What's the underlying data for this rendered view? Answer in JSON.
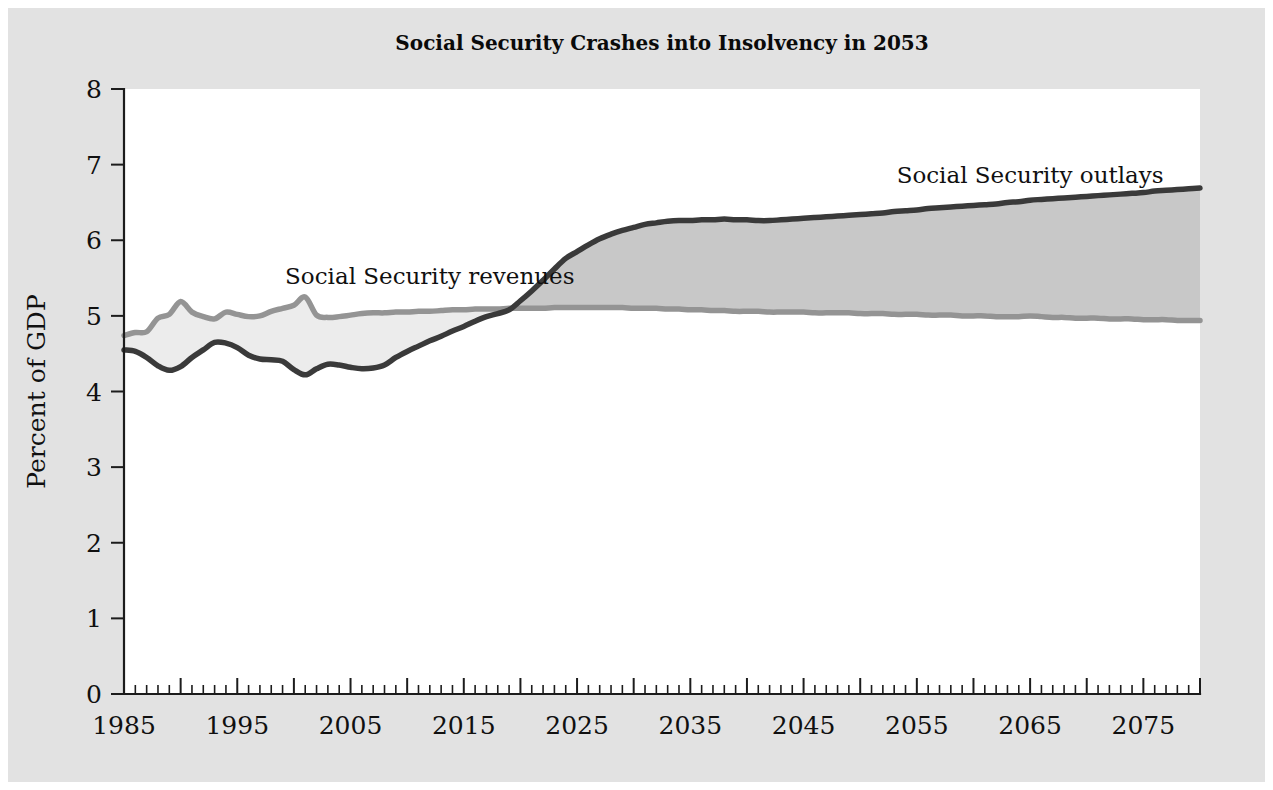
{
  "chart_data": {
    "type": "area",
    "title": "Social Security Crashes into Insolvency in 2053",
    "xlabel": "",
    "ylabel": "Percent of GDP",
    "xlim": [
      1985,
      2080
    ],
    "ylim": [
      0,
      8
    ],
    "ytick_labels": [
      "0",
      "1",
      "2",
      "3",
      "4",
      "5",
      "6",
      "7",
      "8"
    ],
    "ytick_values": [
      0,
      1,
      2,
      3,
      4,
      5,
      6,
      7,
      8
    ],
    "xtick_labels": [
      "1985",
      "1995",
      "2005",
      "2015",
      "2025",
      "2035",
      "2045",
      "2055",
      "2065",
      "2075"
    ],
    "xtick_values": [
      1985,
      1995,
      2005,
      2015,
      2025,
      2035,
      2045,
      2055,
      2065,
      2075
    ],
    "minor_tick_interval": 1,
    "grid": false,
    "legend_position": "inline-annotation",
    "annotations": [
      {
        "text": "Social Security revenues",
        "x": 2012,
        "y": 5.42,
        "name": "revenues-label"
      },
      {
        "text": "Social Security outlays",
        "x": 2065,
        "y": 6.76,
        "name": "outlays-label"
      }
    ],
    "x": [
      1985,
      1986,
      1987,
      1988,
      1989,
      1990,
      1991,
      1992,
      1993,
      1994,
      1995,
      1996,
      1997,
      1998,
      1999,
      2000,
      2001,
      2002,
      2003,
      2004,
      2005,
      2006,
      2007,
      2008,
      2009,
      2010,
      2011,
      2012,
      2013,
      2014,
      2015,
      2016,
      2017,
      2018,
      2019,
      2020,
      2021,
      2022,
      2023,
      2024,
      2025,
      2026,
      2027,
      2028,
      2029,
      2030,
      2031,
      2032,
      2033,
      2034,
      2035,
      2036,
      2037,
      2038,
      2039,
      2040,
      2041,
      2042,
      2043,
      2044,
      2045,
      2046,
      2047,
      2048,
      2049,
      2050,
      2051,
      2052,
      2053,
      2054,
      2055,
      2056,
      2057,
      2058,
      2059,
      2060,
      2061,
      2062,
      2063,
      2064,
      2065,
      2066,
      2067,
      2068,
      2069,
      2070,
      2071,
      2072,
      2073,
      2074,
      2075,
      2076,
      2077,
      2078,
      2079,
      2080
    ],
    "series": [
      {
        "name": "Social Security revenues",
        "color": "#949494",
        "values": [
          4.74,
          4.78,
          4.79,
          4.97,
          5.02,
          5.19,
          5.05,
          4.99,
          4.96,
          5.05,
          5.02,
          4.99,
          5.0,
          5.06,
          5.1,
          5.14,
          5.25,
          5.01,
          4.98,
          4.99,
          5.01,
          5.03,
          5.04,
          5.04,
          5.05,
          5.05,
          5.06,
          5.06,
          5.07,
          5.08,
          5.08,
          5.09,
          5.09,
          5.09,
          5.1,
          5.1,
          5.1,
          5.1,
          5.11,
          5.11,
          5.11,
          5.11,
          5.11,
          5.11,
          5.11,
          5.1,
          5.1,
          5.1,
          5.09,
          5.09,
          5.08,
          5.08,
          5.07,
          5.07,
          5.06,
          5.06,
          5.06,
          5.05,
          5.05,
          5.05,
          5.05,
          5.04,
          5.04,
          5.04,
          5.04,
          5.03,
          5.03,
          5.03,
          5.02,
          5.02,
          5.02,
          5.01,
          5.01,
          5.01,
          5.0,
          5.0,
          5.0,
          4.99,
          4.99,
          4.99,
          5.0,
          4.99,
          4.98,
          4.98,
          4.97,
          4.97,
          4.97,
          4.96,
          4.96,
          4.96,
          4.95,
          4.95,
          4.95,
          4.94,
          4.94,
          4.94
        ]
      },
      {
        "name": "Social Security outlays",
        "color": "#3a3a3a",
        "values": [
          4.55,
          4.53,
          4.45,
          4.34,
          4.28,
          4.33,
          4.45,
          4.55,
          4.65,
          4.64,
          4.58,
          4.48,
          4.43,
          4.42,
          4.4,
          4.29,
          4.22,
          4.3,
          4.36,
          4.35,
          4.32,
          4.3,
          4.31,
          4.35,
          4.45,
          4.53,
          4.6,
          4.67,
          4.73,
          4.8,
          4.86,
          4.93,
          4.99,
          5.03,
          5.08,
          5.2,
          5.33,
          5.47,
          5.62,
          5.76,
          5.85,
          5.94,
          6.02,
          6.08,
          6.13,
          6.17,
          6.21,
          6.23,
          6.25,
          6.26,
          6.26,
          6.27,
          6.27,
          6.28,
          6.27,
          6.27,
          6.26,
          6.26,
          6.27,
          6.28,
          6.29,
          6.3,
          6.31,
          6.32,
          6.33,
          6.34,
          6.35,
          6.36,
          6.38,
          6.39,
          6.4,
          6.42,
          6.43,
          6.44,
          6.45,
          6.46,
          6.47,
          6.48,
          6.5,
          6.51,
          6.53,
          6.54,
          6.55,
          6.56,
          6.57,
          6.58,
          6.59,
          6.6,
          6.61,
          6.62,
          6.63,
          6.65,
          6.66,
          6.67,
          6.68,
          6.69
        ]
      }
    ],
    "fill_surplus_color": "#ececec",
    "fill_deficit_color": "#c8c8c8",
    "crossover_year": 2019
  },
  "figure": {
    "background": "#e2e2e2",
    "plot_background": "#ffffff"
  }
}
